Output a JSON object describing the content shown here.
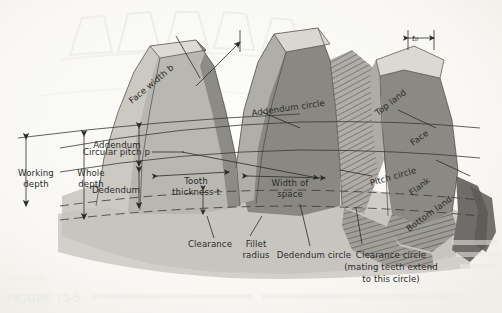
{
  "figure": {
    "type": "technical-line-diagram",
    "media": "scanned textbook page, grayscale halftone with reverse-side bleed-through",
    "canvas": {
      "width": 502,
      "height": 313
    },
    "palette": {
      "paper": "#fbfbf9",
      "paper_shadow": "#f2f1ec",
      "top_land_light": "#d9d6d0",
      "mid_gray": "#b4b2ac",
      "flank_gray": "#9b9994",
      "face_dark": "#8b8984",
      "darkest": "#6f6d69",
      "ink": "#2b2b2b",
      "ghost": "#e9e9e4"
    }
  },
  "labels": {
    "face_width": "Face width b",
    "top_land": "Top land",
    "top_land_dim": "t₀",
    "face": "Face",
    "flank": "Flank",
    "bottom_land": "Bottom land",
    "addendum_circle": "Addendum circle",
    "pitch_circle": "Pitch circle",
    "dedendum_circle": "Dedendum circle",
    "clearance_circle_line1": "Clearance circle",
    "clearance_circle_line2": "(mating teeth extend",
    "clearance_circle_line3": "to this circle)",
    "circular_pitch": "Circular pitch p",
    "addendum": "Addendum",
    "dedendum": "Dedendum",
    "working_depth_line1": "Working",
    "working_depth_line2": "depth",
    "whole_depth_line1": "Whole",
    "whole_depth_line2": "depth",
    "tooth_thickness_line1": "Tooth",
    "tooth_thickness_line2": "thickness t",
    "width_of_space_line1": "Width of",
    "width_of_space_line2": "space",
    "clearance": "Clearance",
    "fillet_radius_line1": "Fillet",
    "fillet_radius_line2": "radius"
  },
  "bleed_through": {
    "bottom_caption": "FIGURE 13-5",
    "note": "faint reverse-side text visible at page bottom and right edge"
  }
}
